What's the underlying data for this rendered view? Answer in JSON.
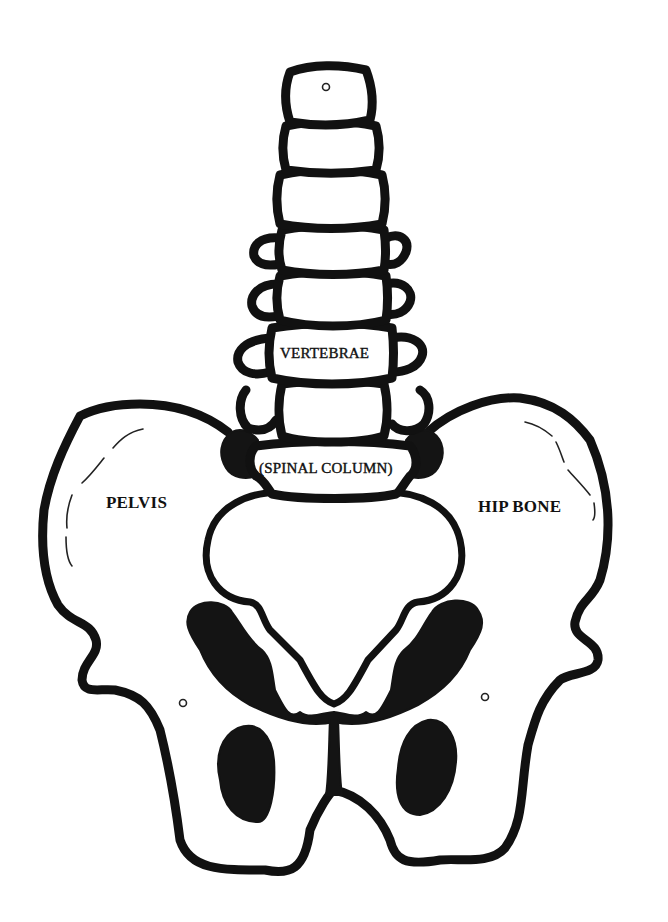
{
  "diagram": {
    "labels": {
      "vertebrae": "VERTEBRAE",
      "spinal_column": "(SPINAL COLUMN)",
      "pelvis": "PELVIS",
      "hip_bone": "HIP BONE"
    },
    "parts": [
      {
        "id": "vertebra-1",
        "name": "Vertebra (top)"
      },
      {
        "id": "vertebra-2",
        "name": "Vertebra"
      },
      {
        "id": "vertebra-3",
        "name": "Vertebra"
      },
      {
        "id": "vertebra-4",
        "name": "Vertebra"
      },
      {
        "id": "vertebra-5",
        "name": "Vertebra"
      },
      {
        "id": "vertebra-6",
        "name": "Vertebra (labelled VERTEBRAE)"
      },
      {
        "id": "vertebra-7",
        "name": "Vertebra"
      },
      {
        "id": "sacrum-top",
        "name": "Sacral body (labelled SPINAL COLUMN)"
      },
      {
        "id": "left-ilium",
        "name": "Left hip wing (labelled PELVIS)"
      },
      {
        "id": "right-ilium",
        "name": "Right hip wing (labelled HIP BONE)"
      },
      {
        "id": "pelvic-inlet",
        "name": "Pelvic opening"
      },
      {
        "id": "obturator-left",
        "name": "Left obturator foramen"
      },
      {
        "id": "obturator-right",
        "name": "Right obturator foramen"
      }
    ],
    "colors": {
      "stroke": "#111111",
      "fill_dark": "#141414",
      "background": "#ffffff"
    }
  }
}
